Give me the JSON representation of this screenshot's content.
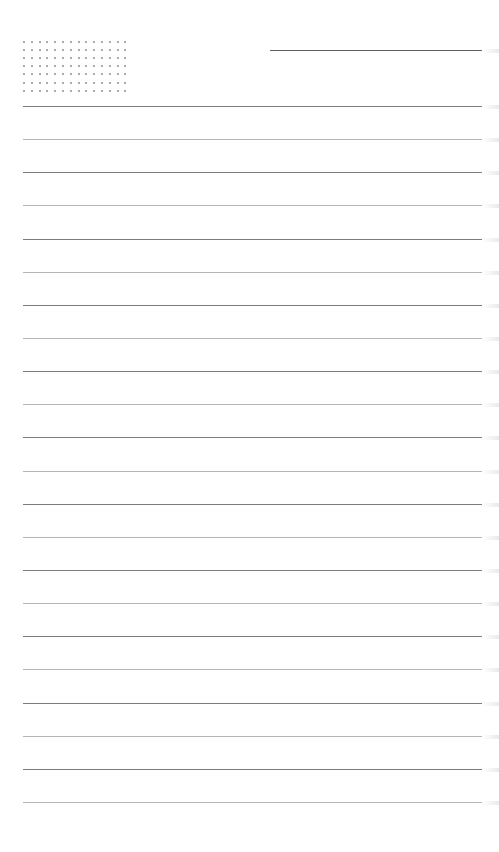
{
  "page": {
    "type": "lined-notepaper",
    "background": "#ffffff",
    "dot_grid": {
      "columns": 14,
      "rows": 7,
      "color": "#8f8f8f"
    },
    "header_line": {
      "color": "#5e5e5e"
    },
    "rules": {
      "count": 22,
      "first_y": 106,
      "spacing": 33.14,
      "colors": [
        "#7c7c7c",
        "#b4b4b4"
      ]
    }
  }
}
